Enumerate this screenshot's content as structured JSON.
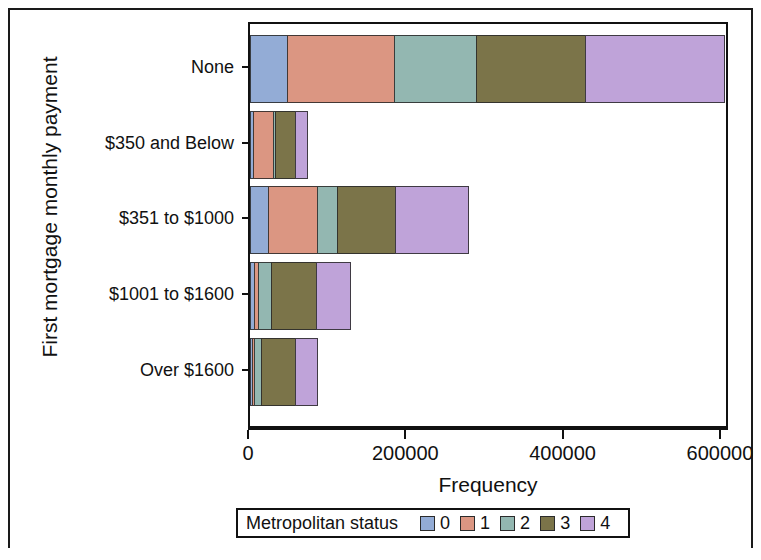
{
  "axes": {
    "y_title": "First mortgage monthly payment",
    "x_title": "Frequency",
    "x_ticks": [
      "0",
      "200000",
      "400000",
      "600000"
    ]
  },
  "legend": {
    "title": "Metropolitan status",
    "items": [
      {
        "label": "0",
        "color": "#93ACD6"
      },
      {
        "label": "1",
        "color": "#DB9682"
      },
      {
        "label": "2",
        "color": "#93B7B1"
      },
      {
        "label": "3",
        "color": "#7B7449"
      },
      {
        "label": "4",
        "color": "#BFA3D9"
      }
    ]
  },
  "chart_data": {
    "type": "bar",
    "orientation": "horizontal",
    "stacked": true,
    "title": "",
    "xlabel": "Frequency",
    "ylabel": "First mortgage monthly payment",
    "xlim": [
      0,
      620000
    ],
    "grid": false,
    "legend_position": "bottom",
    "legend_title": "Metropolitan status",
    "categories": [
      "None",
      "$350 and Below",
      "$351 to $1000",
      "$1001 to $1600",
      "Over $1600"
    ],
    "series": [
      {
        "name": "0",
        "color": "#93ACD6",
        "values": [
          48000,
          5000,
          24000,
          6000,
          4000
        ]
      },
      {
        "name": "1",
        "color": "#DB9682",
        "values": [
          137000,
          27000,
          64000,
          7000,
          3000
        ]
      },
      {
        "name": "2",
        "color": "#93B7B1",
        "values": [
          106000,
          4000,
          27000,
          18000,
          11000
        ]
      },
      {
        "name": "3",
        "color": "#7B7449",
        "values": [
          140000,
          26000,
          75000,
          58000,
          44000
        ]
      },
      {
        "name": "4",
        "color": "#BFA3D9",
        "values": [
          178000,
          17000,
          93000,
          44000,
          29000
        ]
      }
    ],
    "totals": [
      609000,
      79000,
      283000,
      133000,
      91000
    ]
  }
}
